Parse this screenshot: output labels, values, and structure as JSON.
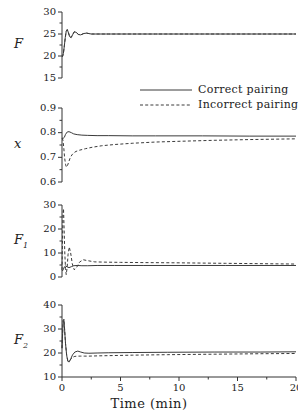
{
  "figure": {
    "xaxis_title": "Time (min)",
    "legend": {
      "correct": "Correct pairing",
      "incorrect": "Incorrect pairing"
    }
  },
  "panels": [
    {
      "ylabel": "F",
      "ylabel_sub": "",
      "yticks": [
        "15",
        "20",
        "25",
        "30"
      ]
    },
    {
      "ylabel": "x",
      "ylabel_sub": "",
      "yticks": [
        "0.6",
        "0.7",
        "0.8",
        "0.9"
      ]
    },
    {
      "ylabel": "F",
      "ylabel_sub": "1",
      "yticks": [
        "0",
        "10",
        "20",
        "30"
      ]
    },
    {
      "ylabel": "F",
      "ylabel_sub": "2",
      "yticks": [
        "10",
        "20",
        "30",
        "40"
      ]
    }
  ],
  "xticks": [
    "0",
    "5",
    "10",
    "15",
    "20"
  ],
  "chart_data": [
    {
      "type": "line",
      "title": "",
      "xlabel": "",
      "ylabel": "F",
      "xlim": [
        0,
        20
      ],
      "ylim": [
        15,
        30
      ],
      "grid": false,
      "legend_position": "center-right-between-panels",
      "series": [
        {
          "name": "Correct pairing",
          "style": "solid",
          "x": [
            0,
            0.05,
            0.12,
            0.2,
            0.28,
            0.36,
            0.45,
            0.55,
            0.65,
            0.78,
            0.9,
            1.05,
            1.2,
            1.4,
            1.6,
            1.85,
            2.1,
            2.5,
            3.0,
            4.0,
            6.0,
            8.0,
            12.0,
            16.0,
            20.0
          ],
          "y": [
            20.0,
            19.9,
            20.6,
            22.3,
            24.2,
            25.6,
            26.0,
            25.3,
            24.4,
            24.2,
            24.8,
            25.5,
            25.4,
            24.9,
            24.8,
            25.1,
            25.2,
            25.0,
            25.0,
            25.0,
            25.0,
            25.0,
            25.0,
            25.0,
            25.0
          ]
        },
        {
          "name": "Incorrect pairing",
          "style": "dashed",
          "x": [
            0,
            0.05,
            0.12,
            0.2,
            0.28,
            0.36,
            0.45,
            0.55,
            0.65,
            0.78,
            0.9,
            1.05,
            1.2,
            1.4,
            1.6,
            1.85,
            2.1,
            2.5,
            3.0,
            4.0,
            6.0,
            8.0,
            12.0,
            16.0,
            20.0
          ],
          "y": [
            20.0,
            19.9,
            20.6,
            22.3,
            24.2,
            25.6,
            26.0,
            25.3,
            24.4,
            24.2,
            24.8,
            25.5,
            25.4,
            24.9,
            24.8,
            25.1,
            25.2,
            25.0,
            25.0,
            25.0,
            25.0,
            25.0,
            25.0,
            25.0,
            25.0
          ]
        }
      ]
    },
    {
      "type": "line",
      "title": "",
      "xlabel": "",
      "ylabel": "x",
      "xlim": [
        0,
        20
      ],
      "ylim": [
        0.6,
        0.9
      ],
      "grid": false,
      "series": [
        {
          "name": "Correct pairing",
          "style": "solid",
          "x": [
            0,
            0.1,
            0.2,
            0.3,
            0.45,
            0.6,
            0.8,
            1.0,
            1.3,
            1.7,
            2.2,
            3.0,
            4.0,
            6.0,
            8.0,
            12.0,
            16.0,
            20.0
          ],
          "y": [
            0.778,
            0.777,
            0.781,
            0.793,
            0.803,
            0.804,
            0.8,
            0.795,
            0.792,
            0.79,
            0.789,
            0.788,
            0.788,
            0.787,
            0.787,
            0.787,
            0.786,
            0.786
          ]
        },
        {
          "name": "Incorrect pairing",
          "style": "dashed",
          "x": [
            0,
            0.08,
            0.15,
            0.22,
            0.3,
            0.38,
            0.48,
            0.58,
            0.7,
            0.85,
            1.0,
            1.2,
            1.5,
            2.0,
            2.6,
            3.4,
            4.5,
            6.0,
            8.0,
            10.0,
            13.0,
            16.0,
            20.0
          ],
          "y": [
            0.778,
            0.77,
            0.74,
            0.7,
            0.672,
            0.66,
            0.668,
            0.682,
            0.698,
            0.71,
            0.718,
            0.724,
            0.729,
            0.735,
            0.741,
            0.747,
            0.752,
            0.757,
            0.762,
            0.765,
            0.769,
            0.772,
            0.775
          ]
        }
      ]
    },
    {
      "type": "line",
      "title": "",
      "xlabel": "",
      "ylabel": "F1",
      "xlim": [
        0,
        20
      ],
      "ylim": [
        0,
        30
      ],
      "grid": false,
      "series": [
        {
          "name": "Correct pairing",
          "style": "solid",
          "x": [
            0,
            0.05,
            0.12,
            0.2,
            0.3,
            0.45,
            0.6,
            0.8,
            1.0,
            1.3,
            1.7,
            2.2,
            3.0,
            4.5,
            7.0,
            10.0,
            14.0,
            20.0
          ],
          "y": [
            3.0,
            2.6,
            3.2,
            4.2,
            4.6,
            4.2,
            3.9,
            4.3,
            4.7,
            4.8,
            4.7,
            4.7,
            4.8,
            4.8,
            4.8,
            4.8,
            4.8,
            4.8
          ]
        },
        {
          "name": "Incorrect pairing",
          "style": "dashed",
          "x": [
            0,
            0.04,
            0.08,
            0.13,
            0.18,
            0.24,
            0.3,
            0.36,
            0.44,
            0.52,
            0.62,
            0.74,
            0.88,
            1.05,
            1.25,
            1.5,
            1.8,
            2.2,
            2.8,
            3.6,
            5.0,
            7.0,
            10.0,
            14.0,
            20.0
          ],
          "y": [
            3.0,
            14.0,
            26.5,
            28.5,
            20.0,
            10.0,
            3.5,
            1.0,
            4.0,
            9.5,
            12.5,
            10.0,
            5.5,
            3.0,
            4.0,
            6.2,
            7.2,
            6.8,
            6.3,
            6.2,
            6.1,
            6.0,
            5.9,
            5.7,
            5.4
          ]
        }
      ]
    },
    {
      "type": "line",
      "title": "",
      "xlabel": "Time (min)",
      "ylabel": "F2",
      "xlim": [
        0,
        20
      ],
      "ylim": [
        10,
        40
      ],
      "grid": false,
      "series": [
        {
          "name": "Correct pairing",
          "style": "solid",
          "x": [
            0,
            0.05,
            0.1,
            0.16,
            0.22,
            0.3,
            0.4,
            0.5,
            0.62,
            0.75,
            0.9,
            1.1,
            1.35,
            1.6,
            1.9,
            2.3,
            3.0,
            4.0,
            6.0,
            9.0,
            13.0,
            17.0,
            20.0
          ],
          "y": [
            22.0,
            28.0,
            33.5,
            34.0,
            30.0,
            24.0,
            19.0,
            16.5,
            16.3,
            17.6,
            19.2,
            20.4,
            20.8,
            20.4,
            20.0,
            19.9,
            20.0,
            20.1,
            20.2,
            20.3,
            20.4,
            20.4,
            20.5
          ]
        },
        {
          "name": "Incorrect pairing",
          "style": "dashed",
          "x": [
            0,
            0.05,
            0.1,
            0.16,
            0.22,
            0.3,
            0.4,
            0.5,
            0.62,
            0.75,
            0.9,
            1.1,
            1.35,
            1.6,
            1.9,
            2.3,
            3.0,
            4.0,
            6.0,
            9.0,
            13.0,
            17.0,
            20.0
          ],
          "y": [
            22.0,
            28.0,
            33.5,
            34.0,
            30.0,
            24.0,
            19.0,
            16.8,
            16.6,
            17.4,
            18.2,
            18.6,
            18.7,
            18.7,
            18.7,
            18.7,
            18.8,
            18.9,
            19.1,
            19.3,
            19.5,
            19.7,
            19.8
          ]
        }
      ]
    }
  ]
}
